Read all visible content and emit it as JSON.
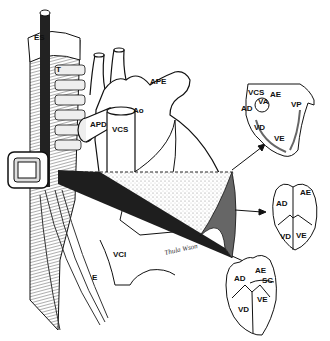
{
  "figure": {
    "type": "anatomical-illustration",
    "main_labels": {
      "es": "ES",
      "t": "T",
      "ape": "APE",
      "ao": "Ao",
      "apd": "APD",
      "vcs": "VCS",
      "vci": "VCI",
      "e": "E"
    },
    "signature": "Thula Wson",
    "inset_1": {
      "labels": [
        "VCS",
        "AE",
        "VA",
        "VP",
        "AD",
        "VD",
        "VE"
      ]
    },
    "inset_2": {
      "labels": [
        "AD",
        "AE",
        "VD",
        "VE"
      ]
    },
    "inset_3": {
      "labels": [
        "AE",
        "AD",
        "SC",
        "VD",
        "VE"
      ]
    },
    "colors": {
      "ink": "#111111",
      "shade": "#555555",
      "plane": "#2a2a2a",
      "stipple": "#bbbbbb",
      "background": "#ffffff"
    }
  }
}
